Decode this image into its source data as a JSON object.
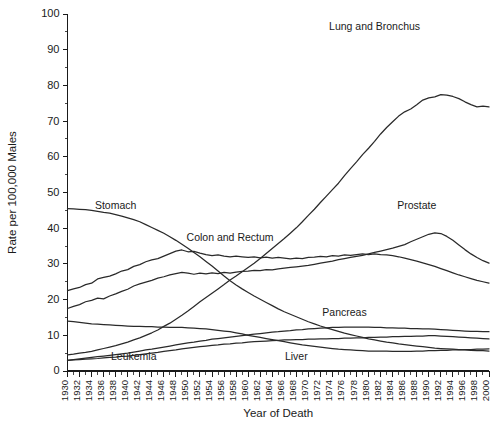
{
  "chart_data": {
    "type": "line",
    "title": "",
    "xlabel": "Year of Death",
    "ylabel": "Rate per 100,000 Males",
    "xlim": [
      1930,
      2000
    ],
    "ylim": [
      0,
      100
    ],
    "grid": false,
    "legend_position": "inline-labels",
    "y_ticks": [
      0,
      10,
      20,
      30,
      40,
      50,
      60,
      70,
      80,
      90,
      100
    ],
    "y_minor_step": 5,
    "x_tick_labels": [
      "1930",
      "1932",
      "1934",
      "1936",
      "1938",
      "1940",
      "1942",
      "1944",
      "1946",
      "1948",
      "1950",
      "1952",
      "1954",
      "1956",
      "1958",
      "1960",
      "1962",
      "1964",
      "1966",
      "1968",
      "1970",
      "1972",
      "1974",
      "1976",
      "1978",
      "1980",
      "1982",
      "1984",
      "1986",
      "1988",
      "1990",
      "1992",
      "1994",
      "1996",
      "1998",
      "2000"
    ],
    "x_minor_step": 1,
    "x": [
      1930,
      1931,
      1932,
      1933,
      1934,
      1935,
      1936,
      1937,
      1938,
      1939,
      1940,
      1941,
      1942,
      1943,
      1944,
      1945,
      1946,
      1947,
      1948,
      1949,
      1950,
      1951,
      1952,
      1953,
      1954,
      1955,
      1956,
      1957,
      1958,
      1959,
      1960,
      1961,
      1962,
      1963,
      1964,
      1965,
      1966,
      1967,
      1968,
      1969,
      1970,
      1971,
      1972,
      1973,
      1974,
      1975,
      1976,
      1977,
      1978,
      1979,
      1980,
      1981,
      1982,
      1983,
      1984,
      1985,
      1986,
      1987,
      1988,
      1989,
      1990,
      1991,
      1992,
      1993,
      1994,
      1995,
      1996,
      1997,
      1998,
      1999,
      2000
    ],
    "series": [
      {
        "name": "Lung and Bronchus",
        "label": "Lung and Bronchus",
        "label_x": 1981,
        "label_y": 95.5,
        "values": [
          4.5,
          4.7,
          5.0,
          5.2,
          5.5,
          5.9,
          6.3,
          6.7,
          7.1,
          7.6,
          8.1,
          8.7,
          9.3,
          10.0,
          10.7,
          11.5,
          12.5,
          13.4,
          14.5,
          15.6,
          16.8,
          18.1,
          19.4,
          20.6,
          21.8,
          23.0,
          24.2,
          25.5,
          26.6,
          27.8,
          29.0,
          30.2,
          31.5,
          32.9,
          34.3,
          35.7,
          37.1,
          38.6,
          40.1,
          41.8,
          43.6,
          45.3,
          47.2,
          49.0,
          50.8,
          52.6,
          54.7,
          56.7,
          58.6,
          60.6,
          62.4,
          64.3,
          66.4,
          68.2,
          69.8,
          71.4,
          72.6,
          73.4,
          74.6,
          75.9,
          76.5,
          76.8,
          77.4,
          77.3,
          76.9,
          76.3,
          75.4,
          74.6,
          74.0,
          74.2,
          74.0
        ]
      },
      {
        "name": "Stomach",
        "label": "Stomach",
        "label_x": 1938,
        "label_y": 45.5,
        "values": [
          45.5,
          45.4,
          45.3,
          45.2,
          45.0,
          44.7,
          44.4,
          44.2,
          43.8,
          43.4,
          42.9,
          42.4,
          41.8,
          41.0,
          40.2,
          39.4,
          38.6,
          37.6,
          36.6,
          35.5,
          34.4,
          33.2,
          32.0,
          30.7,
          29.4,
          28.0,
          26.6,
          25.3,
          24.1,
          23.0,
          22.0,
          21.0,
          20.1,
          19.2,
          18.3,
          17.4,
          16.6,
          15.9,
          15.2,
          14.5,
          13.8,
          13.2,
          12.6,
          12.1,
          11.6,
          11.1,
          10.6,
          10.2,
          9.8,
          9.4,
          9.0,
          8.7,
          8.4,
          8.1,
          7.9,
          7.6,
          7.4,
          7.2,
          7.0,
          6.8,
          6.6,
          6.4,
          6.3,
          6.2,
          6.1,
          6.0,
          5.9,
          5.8,
          5.7,
          5.7,
          5.6
        ]
      },
      {
        "name": "Colon and Rectum",
        "label": "Colon and Rectum",
        "label_x": 1957,
        "label_y": 36.5,
        "values": [
          22.5,
          23.0,
          23.4,
          24.2,
          24.6,
          25.8,
          26.2,
          26.6,
          27.2,
          28.0,
          28.4,
          29.3,
          29.8,
          30.6,
          31.1,
          31.5,
          32.2,
          32.9,
          33.6,
          33.9,
          33.4,
          33.5,
          33.0,
          32.6,
          32.3,
          32.5,
          32.2,
          32.0,
          32.2,
          32.0,
          31.8,
          32.0,
          31.7,
          31.9,
          31.6,
          31.8,
          31.6,
          31.4,
          31.6,
          31.5,
          31.8,
          31.9,
          32.1,
          32.0,
          32.3,
          32.2,
          32.5,
          32.4,
          32.6,
          32.8,
          32.6,
          32.8,
          32.6,
          32.5,
          32.3,
          32.0,
          31.6,
          31.2,
          30.8,
          30.3,
          29.8,
          29.3,
          28.7,
          28.1,
          27.5,
          26.9,
          26.4,
          25.9,
          25.4,
          25.0,
          24.6
        ]
      },
      {
        "name": "Prostate",
        "label": "Prostate",
        "label_x": 1988,
        "label_y": 45.5,
        "values": [
          17.5,
          18.1,
          18.6,
          19.4,
          19.8,
          20.4,
          20.2,
          21.0,
          21.6,
          22.3,
          22.9,
          23.8,
          24.4,
          24.9,
          25.4,
          26.0,
          26.4,
          26.9,
          27.3,
          27.6,
          27.4,
          27.1,
          27.4,
          27.2,
          27.5,
          27.3,
          27.6,
          27.4,
          27.7,
          27.9,
          28.0,
          28.2,
          28.1,
          28.4,
          28.3,
          28.6,
          28.8,
          29.0,
          29.2,
          29.4,
          29.6,
          29.9,
          30.2,
          30.5,
          30.8,
          31.2,
          31.5,
          31.8,
          32.1,
          32.4,
          32.8,
          33.2,
          33.6,
          34.0,
          34.4,
          34.9,
          35.4,
          36.2,
          36.9,
          37.6,
          38.3,
          38.7,
          38.5,
          37.7,
          36.6,
          35.3,
          34.0,
          32.8,
          31.8,
          30.9,
          30.2
        ]
      },
      {
        "name": "Pancreas",
        "label": "Pancreas",
        "label_x": 1976,
        "label_y": 15.5,
        "values": [
          3.0,
          3.2,
          3.4,
          3.6,
          3.8,
          4.0,
          4.2,
          4.4,
          4.6,
          4.8,
          5.0,
          5.3,
          5.6,
          5.9,
          6.1,
          6.4,
          6.7,
          7.0,
          7.3,
          7.6,
          7.9,
          8.1,
          8.4,
          8.6,
          8.9,
          9.1,
          9.3,
          9.5,
          9.7,
          9.9,
          10.1,
          10.3,
          10.5,
          10.7,
          10.9,
          11.0,
          11.2,
          11.3,
          11.5,
          11.6,
          11.8,
          11.9,
          12.0,
          12.1,
          12.2,
          12.2,
          12.3,
          12.3,
          12.3,
          12.3,
          12.3,
          12.2,
          12.2,
          12.1,
          12.1,
          12.0,
          12.0,
          11.9,
          11.9,
          11.8,
          11.8,
          11.7,
          11.6,
          11.5,
          11.4,
          11.3,
          11.2,
          11.1,
          11.1,
          11.0,
          11.0
        ]
      },
      {
        "name": "Leukemia",
        "label": "Leukemia",
        "label_x": 1941,
        "label_y": 3.2,
        "values": [
          3.0,
          3.1,
          3.2,
          3.3,
          3.4,
          3.5,
          3.7,
          3.8,
          3.9,
          4.1,
          4.2,
          4.4,
          4.6,
          4.8,
          5.0,
          5.2,
          5.5,
          5.7,
          5.9,
          6.2,
          6.4,
          6.6,
          6.8,
          7.0,
          7.2,
          7.3,
          7.5,
          7.6,
          7.8,
          7.9,
          8.1,
          8.2,
          8.3,
          8.4,
          8.5,
          8.6,
          8.7,
          8.7,
          8.8,
          8.8,
          8.9,
          8.9,
          9.0,
          9.0,
          9.1,
          9.1,
          9.2,
          9.2,
          9.3,
          9.3,
          9.4,
          9.4,
          9.5,
          9.5,
          9.6,
          9.6,
          9.7,
          9.7,
          9.8,
          9.8,
          9.9,
          9.9,
          9.8,
          9.7,
          9.6,
          9.5,
          9.4,
          9.3,
          9.2,
          9.1,
          9.0
        ]
      },
      {
        "name": "Liver",
        "label": "Liver",
        "label_x": 1968,
        "label_y": 3.2,
        "values": [
          14.0,
          13.8,
          13.6,
          13.4,
          13.2,
          13.1,
          13.0,
          12.9,
          12.8,
          12.7,
          12.6,
          12.5,
          12.5,
          12.4,
          12.4,
          12.3,
          12.3,
          12.2,
          12.2,
          12.2,
          12.1,
          12.0,
          11.9,
          11.8,
          11.6,
          11.4,
          11.2,
          11.0,
          10.7,
          10.4,
          10.0,
          9.7,
          9.4,
          9.1,
          8.8,
          8.5,
          8.2,
          7.9,
          7.6,
          7.3,
          7.1,
          6.9,
          6.7,
          6.5,
          6.3,
          6.1,
          6.0,
          5.9,
          5.8,
          5.7,
          5.6,
          5.6,
          5.6,
          5.6,
          5.5,
          5.5,
          5.5,
          5.5,
          5.6,
          5.6,
          5.7,
          5.7,
          5.8,
          5.8,
          5.9,
          5.9,
          6.0,
          6.0,
          6.1,
          6.1,
          6.2
        ]
      }
    ]
  }
}
